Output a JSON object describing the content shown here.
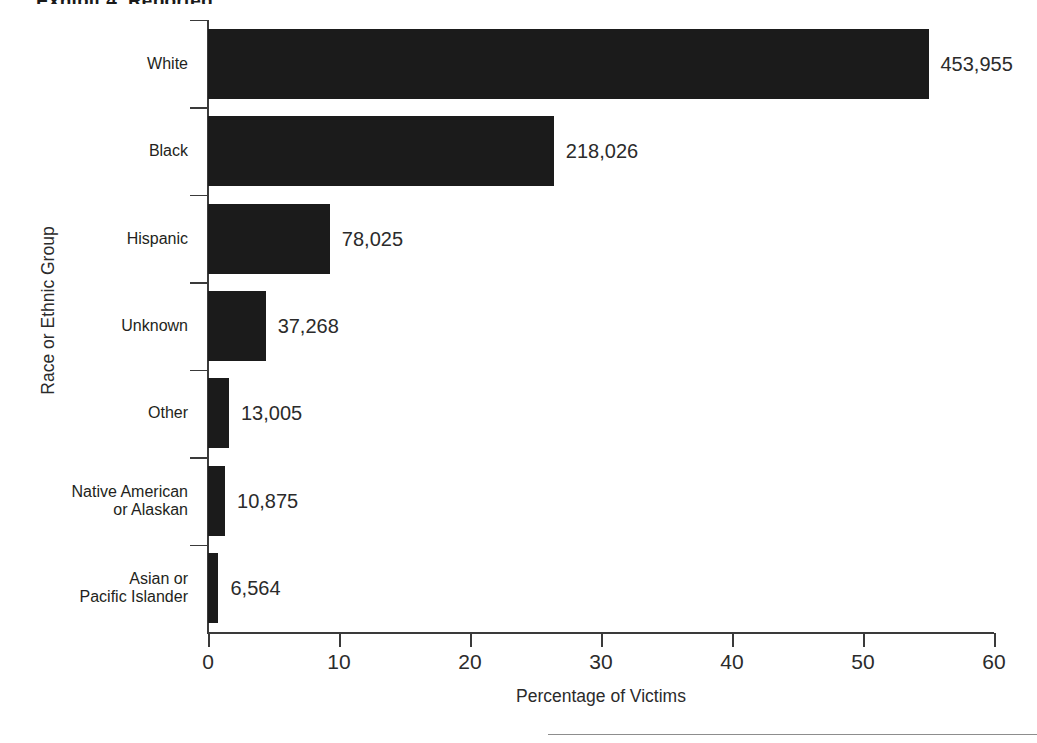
{
  "figure": {
    "title_cropped": "Exhibit 4. Reported",
    "footer_rule": "horizontal-rule"
  },
  "chart_data": {
    "type": "bar",
    "orientation": "horizontal",
    "title": "",
    "xlabel": "Percentage of Victims",
    "ylabel": "Race or Ethnic Group",
    "categories": [
      "White",
      "Black",
      "Hispanic",
      "Unknown",
      "Other",
      "Native American\nor Alaskan",
      "Asian or\nPacific Islander"
    ],
    "values": [
      55.0,
      26.4,
      9.3,
      4.4,
      1.6,
      1.3,
      0.8
    ],
    "data_labels": [
      "453,955",
      "218,026",
      "78,025",
      "37,268",
      "13,005",
      "10,875",
      "6,564"
    ],
    "counts": [
      453955,
      218026,
      78025,
      37268,
      13005,
      10875,
      6564
    ],
    "xlim": [
      0,
      60
    ],
    "xticks": [
      0,
      10,
      20,
      30,
      40,
      50,
      60
    ],
    "xtick_labels": [
      "0",
      "10",
      "20",
      "30",
      "40",
      "50",
      "60"
    ],
    "grid": false,
    "legend": null,
    "bar_color": "#1b1b1b",
    "axis_color": "#3a3a3a",
    "text_color": "#2b2b2b"
  }
}
